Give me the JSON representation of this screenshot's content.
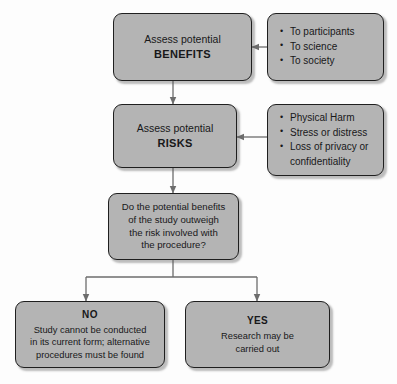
{
  "diagram": {
    "type": "flowchart",
    "palette": {
      "node_fill": "#b4b4b4",
      "node_border": "#1f1f1f",
      "connector": "#6d6d6d",
      "background": "#fdfdfd",
      "text": "#18181a"
    },
    "nodes": [
      {
        "id": "benefits",
        "role": "process",
        "line1": "Assess potential",
        "keyword": "BENEFITS"
      },
      {
        "id": "benefits_list",
        "role": "annotation",
        "items": [
          "To participants",
          "To science",
          "To society"
        ]
      },
      {
        "id": "risks",
        "role": "process",
        "line1": "Assess potential",
        "keyword": "RISKS"
      },
      {
        "id": "risks_list",
        "role": "annotation",
        "items": [
          "Physical Harm",
          "Stress or distress",
          "Loss of privacy or confidentiality"
        ]
      },
      {
        "id": "decision",
        "role": "decision",
        "lines": [
          "Do the potential benefits",
          "of the study outweigh",
          "the risk involved with",
          "the procedure?"
        ]
      },
      {
        "id": "outcome_no",
        "role": "outcome",
        "heading": "NO",
        "lines": [
          "Study cannot be conducted",
          "in its current form; alternative",
          "procedures must be found"
        ]
      },
      {
        "id": "outcome_yes",
        "role": "outcome",
        "heading": "YES",
        "lines": [
          "Research may be",
          "carried out"
        ]
      }
    ],
    "edges": [
      {
        "from": "benefits_list",
        "to": "benefits",
        "direction": "left"
      },
      {
        "from": "benefits",
        "to": "risks",
        "direction": "down"
      },
      {
        "from": "risks_list",
        "to": "risks",
        "direction": "left"
      },
      {
        "from": "risks",
        "to": "decision",
        "direction": "down"
      },
      {
        "from": "decision",
        "to": "outcome_no",
        "direction": "down-left"
      },
      {
        "from": "decision",
        "to": "outcome_yes",
        "direction": "down-right"
      }
    ]
  }
}
